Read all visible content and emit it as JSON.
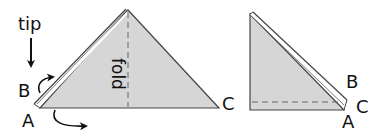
{
  "colors": {
    "paper_fill": "#d6d6d6",
    "outline": "#333333",
    "arrow": "#111111",
    "fold_line": "#666666"
  },
  "left_figure": {
    "tip_label": "tip",
    "fold_label": "fold",
    "corner_labels": {
      "A": "A",
      "B": "B",
      "C": "C"
    }
  },
  "right_figure": {
    "corner_labels": {
      "A": "A",
      "B": "B",
      "C": "C"
    }
  }
}
